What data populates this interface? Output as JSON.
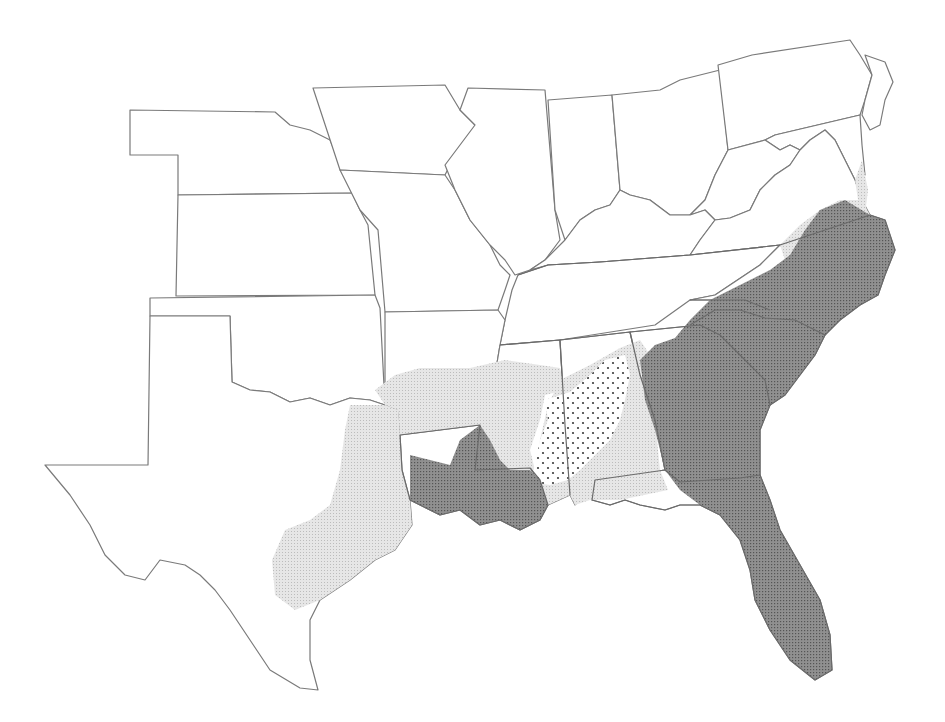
{
  "map": {
    "title": "",
    "region": "Southeastern and Central United States",
    "legend": [],
    "shading": [
      {
        "name": "dark-stipple",
        "color": "#7d7d7d",
        "areas": [
          "Louisiana",
          "Georgia",
          "South Carolina",
          "North Carolina (coastal/piedmont)",
          "Florida",
          "southeast Mississippi edge"
        ]
      },
      {
        "name": "light-stipple",
        "color": "#dcdcdc",
        "areas": [
          "east Texas",
          "southern Arkansas",
          "Mississippi",
          "southern Alabama",
          "Florida panhandle",
          "southern Virginia",
          "Delmarva"
        ]
      },
      {
        "name": "dotted",
        "color": "#3a3a3a",
        "areas": [
          "central Alabama / east Mississippi black belt"
        ]
      }
    ],
    "colors": {
      "background": "#ffffff",
      "border": "#7a7a7a",
      "dark": "#7d7d7d",
      "light": "#dcdcdc",
      "dot": "#3a3a3a"
    }
  }
}
